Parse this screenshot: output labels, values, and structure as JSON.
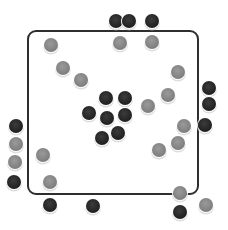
{
  "scene": {
    "frame": {
      "x": 27,
      "y": 30,
      "w": 172,
      "h": 165,
      "color": "#2e2e2e"
    },
    "colors": {
      "dark": "#2a2a2a",
      "grey": "#8a8a8a"
    },
    "dots": [
      {
        "x": 116,
        "y": 21,
        "tone": "dark"
      },
      {
        "x": 129,
        "y": 21,
        "tone": "dark"
      },
      {
        "x": 152,
        "y": 21,
        "tone": "dark"
      },
      {
        "x": 120,
        "y": 43,
        "tone": "grey"
      },
      {
        "x": 152,
        "y": 42,
        "tone": "grey"
      },
      {
        "x": 51,
        "y": 45,
        "tone": "grey"
      },
      {
        "x": 63,
        "y": 68,
        "tone": "grey"
      },
      {
        "x": 81,
        "y": 80,
        "tone": "grey"
      },
      {
        "x": 178,
        "y": 72,
        "tone": "grey"
      },
      {
        "x": 168,
        "y": 95,
        "tone": "grey"
      },
      {
        "x": 148,
        "y": 106,
        "tone": "grey"
      },
      {
        "x": 209,
        "y": 88,
        "tone": "dark"
      },
      {
        "x": 209,
        "y": 104,
        "tone": "dark"
      },
      {
        "x": 205,
        "y": 125,
        "tone": "dark"
      },
      {
        "x": 184,
        "y": 126,
        "tone": "grey"
      },
      {
        "x": 178,
        "y": 143,
        "tone": "grey"
      },
      {
        "x": 159,
        "y": 150,
        "tone": "grey"
      },
      {
        "x": 106,
        "y": 98,
        "tone": "dark"
      },
      {
        "x": 125,
        "y": 98,
        "tone": "dark"
      },
      {
        "x": 89,
        "y": 113,
        "tone": "dark"
      },
      {
        "x": 107,
        "y": 118,
        "tone": "dark"
      },
      {
        "x": 125,
        "y": 115,
        "tone": "dark"
      },
      {
        "x": 102,
        "y": 138,
        "tone": "dark"
      },
      {
        "x": 118,
        "y": 133,
        "tone": "dark"
      },
      {
        "x": 16,
        "y": 126,
        "tone": "dark"
      },
      {
        "x": 16,
        "y": 144,
        "tone": "grey"
      },
      {
        "x": 15,
        "y": 162,
        "tone": "grey"
      },
      {
        "x": 14,
        "y": 182,
        "tone": "dark"
      },
      {
        "x": 43,
        "y": 155,
        "tone": "grey"
      },
      {
        "x": 50,
        "y": 182,
        "tone": "grey"
      },
      {
        "x": 50,
        "y": 205,
        "tone": "dark"
      },
      {
        "x": 93,
        "y": 206,
        "tone": "dark"
      },
      {
        "x": 180,
        "y": 193,
        "tone": "grey"
      },
      {
        "x": 180,
        "y": 212,
        "tone": "dark"
      },
      {
        "x": 206,
        "y": 205,
        "tone": "grey"
      }
    ]
  }
}
